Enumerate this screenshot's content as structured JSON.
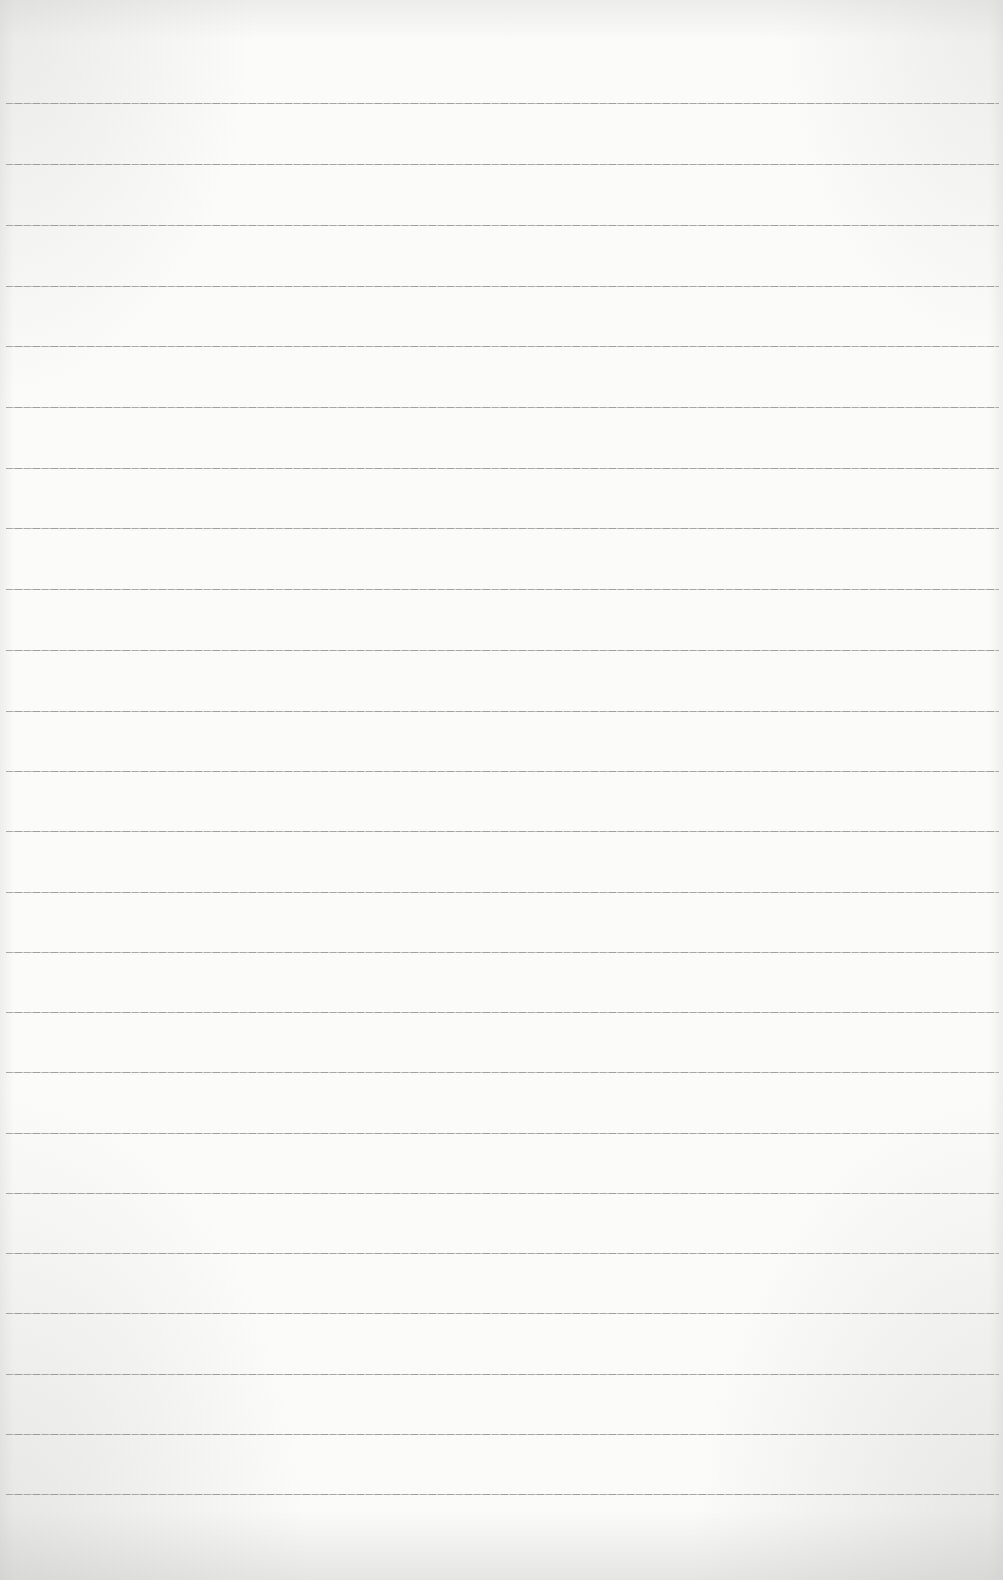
{
  "page": {
    "type": "blank-lined-paper",
    "background_color": "#fbfbfa",
    "line_color": "#9a9a98",
    "rule_lines_y": [
      103,
      164,
      225,
      286,
      346,
      407,
      468,
      528,
      589,
      650,
      711,
      771,
      831,
      892,
      952,
      1012,
      1072,
      1133,
      1193,
      1253,
      1313,
      1374,
      1434,
      1494
    ]
  }
}
